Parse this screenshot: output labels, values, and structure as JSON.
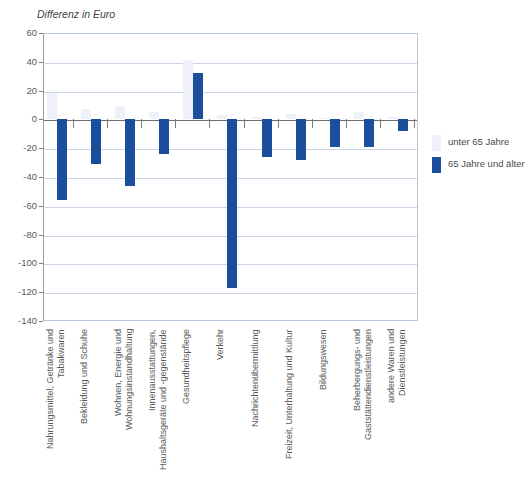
{
  "chart_data": {
    "type": "bar",
    "title": "",
    "ylabel": "Differenz in Euro",
    "xlabel": "",
    "ylim": [
      -140,
      60
    ],
    "ytick_step": 20,
    "yticks": [
      60,
      40,
      20,
      0,
      -20,
      -40,
      -60,
      -80,
      -100,
      -120,
      -140
    ],
    "grid": true,
    "legend_position": "right",
    "categories": [
      "Nahrungsmittel, Getränke und\nTabakwaren",
      "Bekleidung und Schuhe",
      "Wohnen, Energie und\nWohnungsinstandhaltung",
      "Innenausstattungen,\nHaushaltsgeräte und -gegenstände",
      "Gesundheitspflege",
      "Verkehr",
      "Nachrichtenübermittlung",
      "Freizeit, Unterhaltung und Kultur",
      "Bildungswesen",
      "Beherbergungs- und\nGaststättendienstleistungen",
      "andere Waren und\nDienstleistungen"
    ],
    "series": [
      {
        "name": "unter 65 Jahre",
        "color": "#eef2f8",
        "values": [
          18,
          7,
          9,
          5,
          41,
          3,
          2,
          4,
          1,
          5,
          2
        ]
      },
      {
        "name": "65 Jahre und älter",
        "color": "#1b4f9c",
        "values": [
          -56,
          -31,
          -46,
          -24,
          32,
          -117,
          -26,
          -28,
          -19,
          -19,
          -8
        ]
      }
    ]
  },
  "legend": {
    "items": [
      {
        "label": "unter 65 Jahre",
        "color": "#eef2f8"
      },
      {
        "label": "65 Jahre und älter",
        "color": "#1b4f9c"
      }
    ]
  }
}
